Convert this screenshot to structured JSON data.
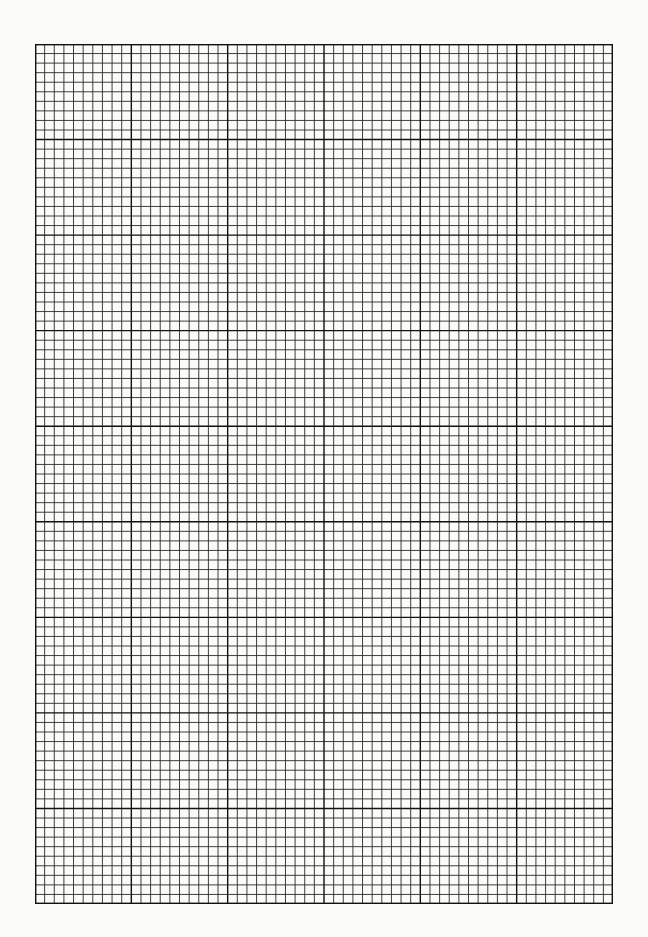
{
  "page": {
    "type": "graph-paper",
    "background_color": "#fbfbf7",
    "line_color": "#2a2a2a"
  },
  "grid": {
    "columns": 60,
    "rows": 90,
    "major_every": 10,
    "left": 35,
    "top": 44,
    "width": 578,
    "height": 860
  }
}
